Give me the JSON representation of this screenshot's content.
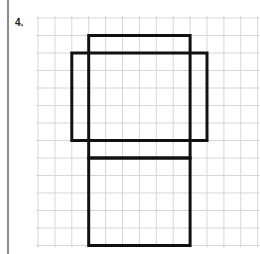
{
  "problem": {
    "number_label": "4."
  },
  "grid": {
    "origin_x": 38,
    "origin_y": 18,
    "cell_w": 16.9,
    "cell_h": 17.5,
    "cols": 13,
    "rows": 13,
    "line_color": "#d6d6d6"
  },
  "figure": {
    "stroke_color": "#111111",
    "stroke_width": 3,
    "rectangles": [
      {
        "name": "top-rectangle",
        "col": 3,
        "row": 1,
        "w": 6,
        "h": 7
      },
      {
        "name": "wide-rectangle",
        "col": 2,
        "row": 2,
        "w": 8,
        "h": 5
      },
      {
        "name": "bottom-rectangle",
        "col": 3,
        "row": 8,
        "w": 6,
        "h": 5
      }
    ]
  }
}
